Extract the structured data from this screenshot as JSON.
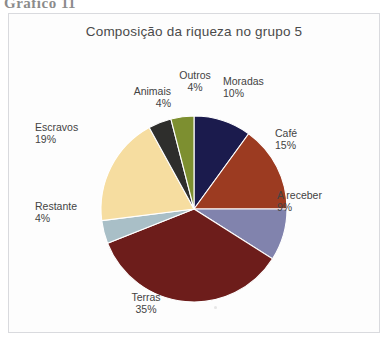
{
  "figure": {
    "caption": "Gráfico 11"
  },
  "chart": {
    "title": "Composição da riqueza no grupo 5"
  },
  "chart_data": {
    "type": "pie",
    "title": "Composição da riqueza no grupo 5",
    "xlabel": "",
    "ylabel": "",
    "unit": "%",
    "start_angle_deg": 0,
    "direction": "clockwise",
    "legend": "none (labels placed around pie)",
    "grid": false,
    "categories": [
      "Moradas",
      "Café",
      "A receber",
      "Terras",
      "Restante",
      "Escravos",
      "Animais",
      "Outros"
    ],
    "values": [
      10,
      15,
      9,
      35,
      4,
      19,
      4,
      4
    ],
    "colors": [
      "#1b1b4d",
      "#9c3b21",
      "#8183ad",
      "#6d1d1b",
      "#a9bfc7",
      "#f6dda0",
      "#2e2e2c",
      "#7d8f30"
    ],
    "slices": [
      {
        "label": "Moradas",
        "value": 10,
        "value_text": "10%",
        "color": "#1b1b4d"
      },
      {
        "label": "Café",
        "value": 15,
        "value_text": "15%",
        "color": "#9c3b21"
      },
      {
        "label": "A receber",
        "value": 9,
        "value_text": "9%",
        "color": "#8183ad"
      },
      {
        "label": "Terras",
        "value": 35,
        "value_text": "35%",
        "color": "#6d1d1b"
      },
      {
        "label": "Restante",
        "value": 4,
        "value_text": "4%",
        "color": "#a9bfc7"
      },
      {
        "label": "Escravos",
        "value": 19,
        "value_text": "19%",
        "color": "#f6dda0"
      },
      {
        "label": "Animais",
        "value": 4,
        "value_text": "4%",
        "color": "#2e2e2c"
      },
      {
        "label": "Outros",
        "value": 4,
        "value_text": "4%",
        "color": "#7d8f30"
      }
    ]
  }
}
